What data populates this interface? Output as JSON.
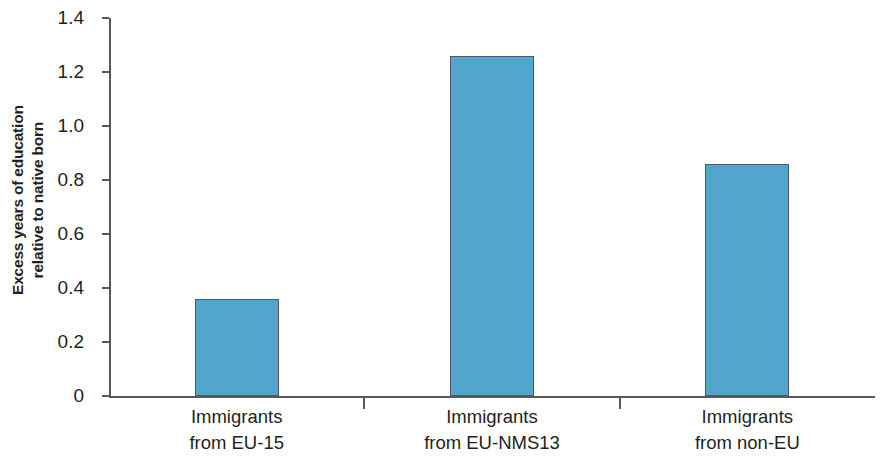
{
  "chart_data": {
    "type": "bar",
    "title": "",
    "subtitle": "",
    "xlabel": "",
    "ylabel_line1": "Excess years of education",
    "ylabel_line2": "relative to native born",
    "ylabel": "Excess years of education relative to native born",
    "categories": [
      "Immigrants from EU-15",
      "Immigrants from EU-NMS13",
      "Immigrants from non-EU"
    ],
    "category_lines": [
      {
        "line1": "Immigrants",
        "line2": "from EU-15"
      },
      {
        "line1": "Immigrants",
        "line2": "from EU-NMS13"
      },
      {
        "line1": "Immigrants",
        "line2": "from non-EU"
      }
    ],
    "values": [
      0.36,
      1.26,
      0.86
    ],
    "ylim": [
      0,
      1.4
    ],
    "ytick_values": [
      0,
      0.2,
      0.4,
      0.6,
      0.8,
      1.0,
      1.2,
      1.4
    ],
    "ytick_labels": [
      "0",
      "0.2",
      "0.4",
      "0.6",
      "0.8",
      "1.0",
      "1.2",
      "1.4"
    ],
    "grid": false,
    "legend": false,
    "legend_position": "none",
    "bar_color": "#52a6cd",
    "bar_border_color": "#4c5a66",
    "axis_color": "#58595b",
    "background_color": "#ffffff"
  }
}
